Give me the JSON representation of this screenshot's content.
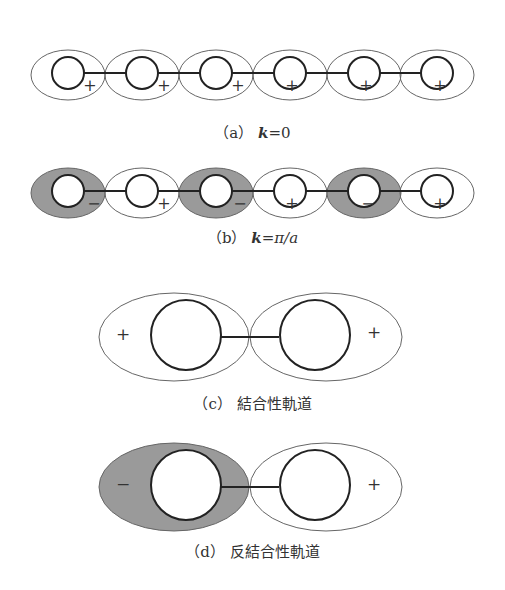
{
  "colors": {
    "shade": "#9a9a9a",
    "stroke": "#222222",
    "thin": "#555555",
    "background": "#ffffff"
  },
  "panels": {
    "a": {
      "label": "（a）",
      "k_symbol": "k",
      "k_value": "=0",
      "signs": [
        "+",
        "+",
        "+",
        "+",
        "+",
        "+"
      ]
    },
    "b": {
      "label": "（b）",
      "k_symbol": "k",
      "k_value": "=π/a",
      "signs": [
        "−",
        "+",
        "−",
        "+",
        "−",
        "+"
      ]
    },
    "c": {
      "label": "（c）",
      "title": "結合性軌道",
      "signs": [
        "+",
        "+"
      ]
    },
    "d": {
      "label": "（d）",
      "title": "反結合性軌道",
      "signs": [
        "−",
        "+"
      ]
    }
  }
}
